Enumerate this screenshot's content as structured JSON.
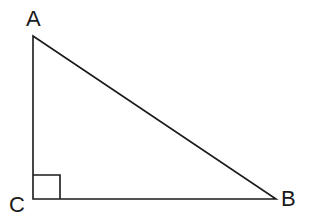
{
  "diagram": {
    "type": "right-triangle",
    "vertices": [
      {
        "label": "A",
        "x": 33,
        "y": 36
      },
      {
        "label": "B",
        "x": 276,
        "y": 199
      },
      {
        "label": "C",
        "x": 33,
        "y": 199
      }
    ],
    "right_angle_at": "C",
    "labels": {
      "a": "A",
      "b": "B",
      "c": "C"
    },
    "stroke_color": "#1a1a1a"
  }
}
